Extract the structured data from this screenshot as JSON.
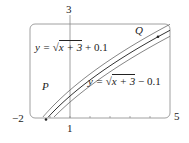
{
  "chart_data": {
    "type": "line",
    "title": "",
    "xlabel": "",
    "ylabel": "",
    "xlim": [
      -2,
      5
    ],
    "ylim": [
      1,
      3
    ],
    "x_tick_labels": [
      "-2",
      "1",
      "5"
    ],
    "y_tick_labels": [
      "3"
    ],
    "grid": false,
    "series": [
      {
        "name": "y = √(x+3) + 0.1",
        "offset": 0.1
      },
      {
        "name": "y = √(x+3)",
        "offset": 0
      },
      {
        "name": "y = √(x+3) − 0.1",
        "offset": -0.1
      }
    ],
    "points": [
      {
        "label": "P",
        "x": -1.2,
        "y": 1.34
      },
      {
        "label": "Q",
        "x": 4.4,
        "y": 2.72
      }
    ],
    "annotations": [
      "y = √(x+3) + 0.1",
      "y = √(x+3) − 0.1",
      "P",
      "Q"
    ]
  },
  "labels": {
    "upper_eq_prefix": "y = ",
    "upper_eq_radicand": "x + 3",
    "upper_eq_suffix": " + 0.1",
    "lower_eq_prefix": "y = ",
    "lower_eq_radicand": "x + 3",
    "lower_eq_suffix": " − 0.1",
    "point_p": "P",
    "point_q": "Q",
    "x_min": "−2",
    "x_max": "5",
    "x_one": "1",
    "y_max": "3"
  }
}
